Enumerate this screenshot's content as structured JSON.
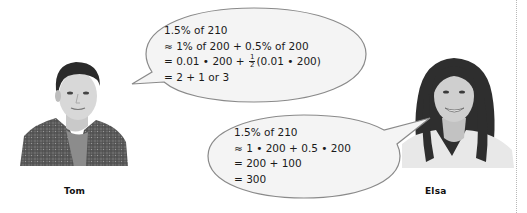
{
  "characters": {
    "tom": {
      "name": "Tom"
    },
    "elsa": {
      "name": "Elsa"
    }
  },
  "tom_bubble": {
    "lines": [
      "1.5% of 210",
      "≈ 1% of 200 + 0.5% of 200",
      "= 0.01 • 200 + ",
      "= 2 + 1 or 3"
    ],
    "line3_fraction": {
      "numerator": "1",
      "denominator": "2"
    },
    "line3_tail": "(0.01 • 200)"
  },
  "elsa_bubble": {
    "lines": [
      "1.5% of 210",
      "≈ 1 • 200 + 0.5 • 200",
      "= 200 + 100",
      "= 300"
    ]
  },
  "colors": {
    "bubble_fill": "#f4f4f4",
    "bubble_stroke": "#8a8a8a",
    "background": "#ffffff"
  }
}
